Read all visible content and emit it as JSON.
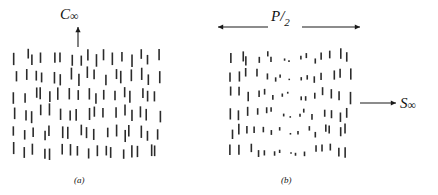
{
  "figure": {
    "width": 438,
    "height": 195,
    "background": "#ffffff",
    "ink": "#2b2b2b",
    "text_color": "#111111"
  },
  "panels": [
    {
      "id": "a",
      "caption": "(a)",
      "caption_x": 74,
      "caption_y": 175,
      "box": {
        "x": 12,
        "y": 48,
        "width": 150,
        "height": 112
      },
      "description": "nematic-like array of uniform vertical dashes",
      "dash_model": {
        "type": "uniform",
        "rows": 6,
        "cols": 17,
        "dash_length": 11,
        "dash_width": 1.6,
        "jitter_x": 3.2,
        "jitter_y": 4.0,
        "seed": 1234
      },
      "axis_label": {
        "symbol": "C",
        "subscript": "∞",
        "text": "C∞",
        "label_x": 60,
        "label_y": 6,
        "arrow": {
          "direction": "up",
          "x1": 78,
          "y1": 47,
          "x2": 78,
          "y2": 27
        }
      }
    },
    {
      "id": "b",
      "caption": "(b)",
      "caption_x": 281,
      "caption_y": 175,
      "box": {
        "x": 228,
        "y": 48,
        "width": 124,
        "height": 112
      },
      "description": "cholesteric half-pitch: dashes foreshorten to dots at the centre band",
      "dash_model": {
        "type": "foreshortened",
        "rows": 6,
        "cols": 15,
        "dash_length": 11,
        "min_dash_length": 1.4,
        "dash_width": 1.6,
        "center_fraction": 0.5,
        "jitter_x": 3.0,
        "jitter_y": 4.0,
        "seed": 8891
      },
      "pitch_label": {
        "numerator": "P",
        "solidus": "/",
        "denominator": "2",
        "text": "P/2",
        "label_x": 271,
        "label_y": 8,
        "arrow_left": {
          "direction": "left",
          "x1": 268,
          "y1": 27,
          "x2": 218,
          "y2": 27
        },
        "arrow_right": {
          "direction": "right",
          "x1": 302,
          "y1": 27,
          "x2": 360,
          "y2": 27
        }
      },
      "axis_label": {
        "symbol": "S",
        "subscript": "∞",
        "text": "S∞",
        "label_x": 400,
        "label_y": 95,
        "arrow": {
          "direction": "right",
          "x1": 360,
          "y1": 103,
          "x2": 396,
          "y2": 103
        }
      }
    }
  ]
}
